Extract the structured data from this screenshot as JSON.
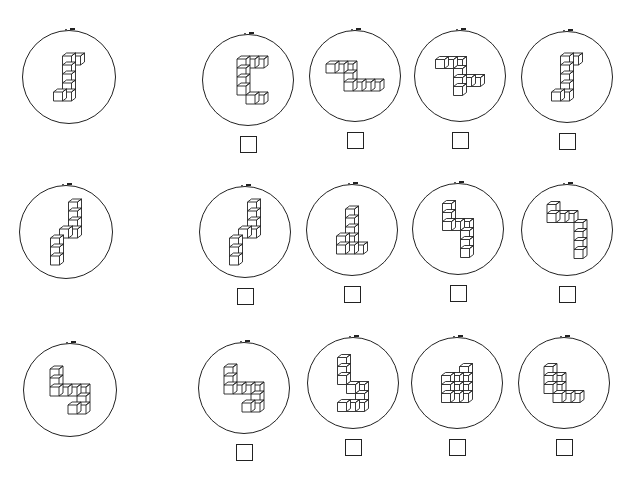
{
  "task": {
    "type": "mental-rotation-test",
    "rows": 3,
    "options_per_row": 4
  },
  "colors": {
    "line": "#222222",
    "background": "#ffffff"
  },
  "rows": [
    {
      "reference": {
        "shape": "block-figure-s-shape",
        "cx": 69,
        "cy": 77,
        "r": 47
      },
      "options": [
        {
          "cx": 248,
          "cy": 80,
          "r": 46,
          "shape": "block-figure-c-shape",
          "checked": false
        },
        {
          "cx": 355,
          "cy": 76,
          "r": 46,
          "shape": "block-figure-z-shape",
          "checked": false
        },
        {
          "cx": 460,
          "cy": 76,
          "r": 46,
          "shape": "block-figure-z-shape-tall",
          "checked": false
        },
        {
          "cx": 567,
          "cy": 77,
          "r": 46,
          "shape": "block-figure-s-shape",
          "checked": false
        }
      ]
    },
    {
      "reference": {
        "shape": "block-figure-zigzag",
        "cx": 66,
        "cy": 232,
        "r": 47
      },
      "options": [
        {
          "cx": 245,
          "cy": 232,
          "r": 46,
          "shape": "block-figure-zigzag",
          "checked": false
        },
        {
          "cx": 352,
          "cy": 230,
          "r": 46,
          "shape": "block-figure-zigzag-tall",
          "checked": false
        },
        {
          "cx": 458,
          "cy": 229,
          "r": 46,
          "shape": "block-figure-step",
          "checked": false
        },
        {
          "cx": 567,
          "cy": 230,
          "r": 46,
          "shape": "block-figure-step-long",
          "checked": false
        }
      ]
    },
    {
      "reference": {
        "shape": "block-figure-hook",
        "cx": 70,
        "cy": 390,
        "r": 47
      },
      "options": [
        {
          "cx": 244,
          "cy": 388,
          "r": 46,
          "shape": "block-figure-hook",
          "checked": false
        },
        {
          "cx": 353,
          "cy": 383,
          "r": 46,
          "shape": "block-figure-hook-tall",
          "checked": false
        },
        {
          "cx": 457,
          "cy": 383,
          "r": 46,
          "shape": "block-figure-stacked",
          "checked": false
        },
        {
          "cx": 564,
          "cy": 383,
          "r": 46,
          "shape": "block-figure-l-shape",
          "checked": false
        }
      ]
    }
  ]
}
